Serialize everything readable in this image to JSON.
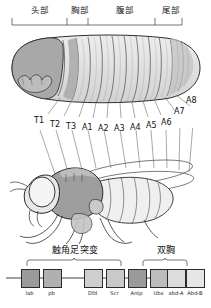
{
  "figure": {
    "top_regions": [
      {
        "id": "head",
        "label": "头部"
      },
      {
        "id": "thorax",
        "label": "胸部"
      },
      {
        "id": "abdomen",
        "label": "腹部"
      },
      {
        "id": "tail",
        "label": "尾部"
      }
    ],
    "segments": [
      {
        "id": "T1",
        "label": "T1"
      },
      {
        "id": "T2",
        "label": "T2"
      },
      {
        "id": "T3",
        "label": "T3"
      },
      {
        "id": "A1",
        "label": "A1"
      },
      {
        "id": "A2",
        "label": "A2"
      },
      {
        "id": "A3",
        "label": "A3"
      },
      {
        "id": "A4",
        "label": "A4"
      },
      {
        "id": "A5",
        "label": "A5"
      },
      {
        "id": "A6",
        "label": "A6"
      },
      {
        "id": "A7",
        "label": "A7"
      },
      {
        "id": "A8",
        "label": "A8"
      }
    ],
    "clusters": [
      {
        "id": "antennapedia",
        "label": "触角足突变"
      },
      {
        "id": "bithorax",
        "label": "双胸"
      }
    ],
    "genes": [
      {
        "id": "lab",
        "label": "lab",
        "color": "#9b9b9b"
      },
      {
        "id": "pb",
        "label": "pb",
        "color": "#b0b0b0"
      },
      {
        "id": "Dfd",
        "label": "Dfd",
        "color": "#cfcfcf"
      },
      {
        "id": "Scr",
        "label": "Scr",
        "color": "#c9c9c9"
      },
      {
        "id": "Antp",
        "label": "Antp",
        "color": "#9a9a9a"
      },
      {
        "id": "Ubx",
        "label": "Ubx",
        "color": "#bdbdbd"
      },
      {
        "id": "abd-A",
        "label": "abd-A",
        "color": "#dcdcdc"
      },
      {
        "id": "Abd-B",
        "label": "Abd-B",
        "color": "#e6e6e6"
      }
    ],
    "illustrations": [
      {
        "id": "larva",
        "name": "drosophila-larva-drawing"
      },
      {
        "id": "adult",
        "name": "drosophila-adult-fly-drawing"
      }
    ],
    "colors": {
      "ink": "#1b1b1b",
      "rule": "#3a3a3a",
      "leader": "#6f6f6f",
      "fill_light": "#f0f0f0",
      "fill_mid": "#c8c8c8",
      "fill_dark": "#9a9a9a",
      "background": "#ffffff"
    }
  }
}
